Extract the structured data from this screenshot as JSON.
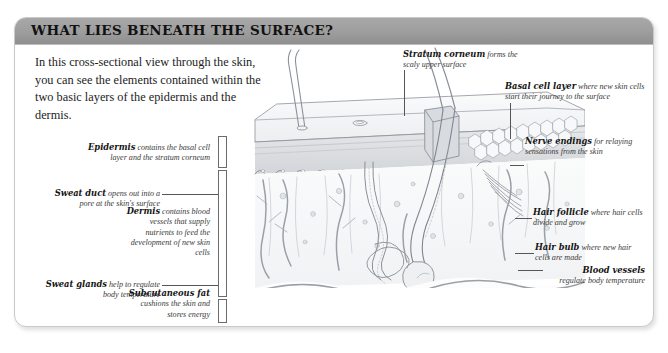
{
  "card": {
    "title": "WHAT LIES BENEATH THE SURFACE?",
    "intro": "In this cross-sectional view through the skin, you can see the elements contained within the two basic layers of the epidermis and the dermis."
  },
  "colors": {
    "titlebar": "#9d9d9d",
    "border": "#c9c9c9",
    "text": "#141414",
    "leader": "#565656",
    "ink": "#8a8f96",
    "fill_light": "#f4f5f6",
    "fill_mid": "#e3e5e8"
  },
  "labels": {
    "epidermis": {
      "term": "Epidermis",
      "desc": "contains the basal cell layer and the stratum corneum"
    },
    "sweat_duct": {
      "term": "Sweat duct",
      "desc": "opens out into a pore at the skin's surface"
    },
    "sweat_glands": {
      "term": "Sweat glands",
      "desc": "help to regulate body temperature"
    },
    "dermis": {
      "term": "Dermis",
      "desc": "contains blood vessels that supply nutrients to feed the development of new skin cells"
    },
    "subcutaneous": {
      "term": "Subcutaneous fat",
      "desc": "cushions the skin and stores energy"
    },
    "stratum": {
      "term": "Stratum corneum",
      "desc": "forms the scaly upper surface"
    },
    "basal": {
      "term": "Basal cell layer",
      "desc": "where new skin cells start their journey to the surface"
    },
    "nerve": {
      "term": "Nerve endings",
      "desc": "for relaying sensations from the skin"
    },
    "follicle": {
      "term": "Hair follicle",
      "desc": "where hair cells divide and grow"
    },
    "bulb": {
      "term": "Hair bulb",
      "desc": "where new hair cells are made"
    },
    "blood": {
      "term": "Blood vessels",
      "desc": "regulate body temperature"
    }
  },
  "diagram": {
    "type": "labelled-anatomical-cross-section",
    "layers": [
      "epidermis",
      "dermis",
      "subcutaneous fat"
    ],
    "structures": [
      "hair shaft",
      "hair follicle",
      "hair bulb",
      "sweat duct",
      "sweat gland",
      "pore",
      "blood vessels",
      "nerve endings",
      "stratum corneum",
      "basal cell layer"
    ]
  }
}
